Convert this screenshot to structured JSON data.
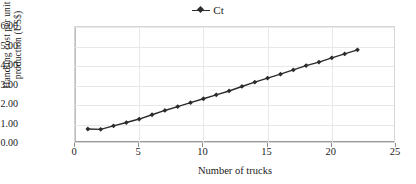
{
  "chart_data": {
    "type": "line",
    "title": "",
    "xlabel": "Number of trucks",
    "ylabel": "Handling cost per unit production (US$)",
    "ylabel_line1": "Handling cost per unit",
    "ylabel_line2": "production (US$)",
    "legend": [
      {
        "name": "Ct",
        "marker": "line-with-diamond",
        "color": "#2b2b2b"
      }
    ],
    "legend_position": "top-center",
    "grid": true,
    "xlim": [
      0,
      25
    ],
    "ylim": [
      0,
      6
    ],
    "xticks": [
      "0",
      "5",
      "10",
      "15",
      "20",
      "25"
    ],
    "xtick_values": [
      0,
      5,
      10,
      15,
      20,
      25
    ],
    "yticks": [
      "0.00",
      "1.00",
      "2.00",
      "3.00",
      "4.00",
      "5.00",
      "6.00"
    ],
    "ytick_values": [
      0,
      1,
      2,
      3,
      4,
      5,
      6
    ],
    "series": [
      {
        "name": "Ct",
        "color": "#2b2b2b",
        "x": [
          1,
          2,
          3,
          4,
          5,
          6,
          7,
          8,
          9,
          10,
          11,
          12,
          13,
          14,
          15,
          16,
          17,
          18,
          19,
          20,
          21,
          22
        ],
        "values": [
          0.77,
          0.75,
          0.93,
          1.1,
          1.28,
          1.5,
          1.72,
          1.92,
          2.12,
          2.32,
          2.52,
          2.72,
          2.95,
          3.17,
          3.38,
          3.58,
          3.8,
          4.02,
          4.2,
          4.42,
          4.62,
          4.83
        ]
      }
    ]
  },
  "legend": {
    "entries": [
      {
        "label": "Ct"
      }
    ]
  },
  "axes": {
    "x_title": "Number of trucks",
    "y_title_line1": "Handling cost per unit",
    "y_title_line2": "production (US$)"
  }
}
